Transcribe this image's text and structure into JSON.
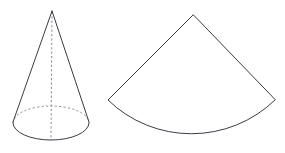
{
  "figure": {
    "background_color": "#ffffff",
    "stroke_color": "#3c3c46",
    "dashed_stroke_color": "#8a8a93",
    "fill_color": "#ffffff",
    "stroke_width": 1,
    "canvas": {
      "width": 285,
      "height": 153
    }
  },
  "shapes": {
    "cone": {
      "name": "cone",
      "apex": {
        "x": 52,
        "y": 11
      },
      "base_ellipse": {
        "cx": 51,
        "cy": 123,
        "rx": 38,
        "ry": 17
      },
      "left_slant": {
        "x1": 52,
        "y1": 11,
        "x2": 13,
        "y2": 122
      },
      "right_slant": {
        "x1": 52,
        "y1": 11,
        "x2": 89,
        "y2": 122
      },
      "axis": {
        "x1": 52,
        "y1": 12,
        "x2": 51,
        "y2": 140,
        "style": "dashed"
      },
      "front_arc_style": "solid",
      "back_arc_style": "dashed",
      "path_front_arc": "M 13 123 A 38 17 0 0 0 89 123",
      "path_back_arc": "M 13 123 A 38 17 0 0 1 89 123"
    },
    "sector": {
      "name": "circular-sector-net",
      "apex": {
        "x": 193,
        "y": 15
      },
      "left_tip": {
        "x": 108,
        "y": 100
      },
      "right_tip": {
        "x": 275,
        "y": 100
      },
      "arc_midpoint": {
        "x": 192,
        "y": 140
      },
      "radius": 120,
      "arc_sweep_degrees": 98,
      "path": "M 193 15 L 108 100 A 120 120 0 0 0 275 100 Z"
    }
  }
}
